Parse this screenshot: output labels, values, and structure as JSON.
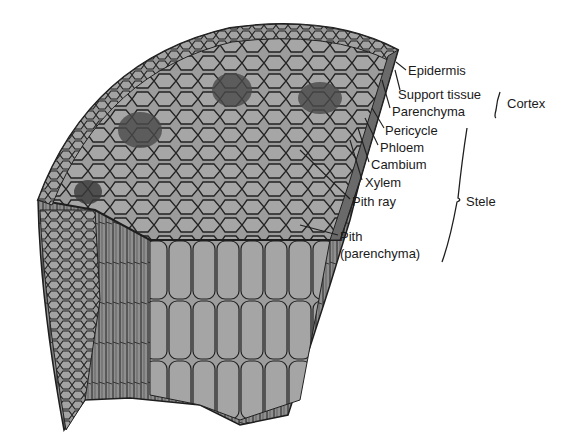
{
  "diagram": {
    "labels": [
      {
        "id": "epidermis",
        "text": "Epidermis",
        "x": 408,
        "y": 63
      },
      {
        "id": "support",
        "text": "Support tissue",
        "x": 398,
        "y": 87
      },
      {
        "id": "parenchyma",
        "text": "Parenchyma",
        "x": 392,
        "y": 104
      },
      {
        "id": "pericycle",
        "text": "Pericycle",
        "x": 385,
        "y": 123
      },
      {
        "id": "phloem",
        "text": "Phloem",
        "x": 380,
        "y": 140
      },
      {
        "id": "cambium",
        "text": "Cambium",
        "x": 371,
        "y": 157
      },
      {
        "id": "xylem",
        "text": "Xylem",
        "x": 365,
        "y": 175
      },
      {
        "id": "pithray",
        "text": "Pith ray",
        "x": 352,
        "y": 194
      },
      {
        "id": "pith",
        "text": "Pith",
        "x": 340,
        "y": 229
      },
      {
        "id": "pith2",
        "text": "(parenchyma)",
        "x": 340,
        "y": 246
      }
    ],
    "groups": [
      {
        "id": "cortex",
        "text": "Cortex",
        "x": 507,
        "y": 96
      },
      {
        "id": "stele",
        "text": "Stele",
        "x": 466,
        "y": 194
      }
    ],
    "colors": {
      "tissue": "#9a9a9a",
      "line": "#1e1e1e",
      "dark": "#3a3a3a"
    }
  }
}
